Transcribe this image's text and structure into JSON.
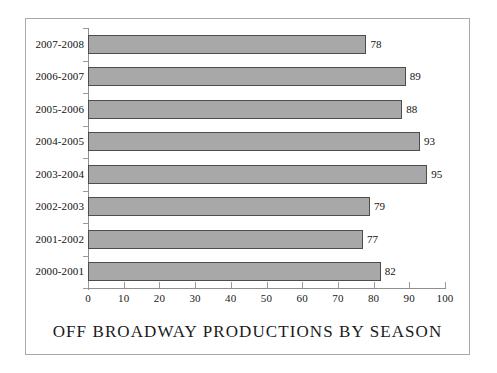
{
  "chart_data": {
    "type": "bar",
    "orientation": "horizontal",
    "title": "OFF BROADWAY PRODUCTIONS BY SEASON",
    "xlabel": "",
    "ylabel": "",
    "categories": [
      "2000-2001",
      "2001-2002",
      "2002-2003",
      "2003-2004",
      "2004-2005",
      "2005-2006",
      "2006-2007",
      "2007-2008"
    ],
    "values": [
      82,
      77,
      79,
      95,
      93,
      88,
      89,
      78
    ],
    "data_labels": [
      "82",
      "77",
      "79",
      "95",
      "93",
      "88",
      "89",
      "78"
    ],
    "xlim": [
      0,
      100
    ],
    "xticks": [
      0,
      10,
      20,
      30,
      40,
      50,
      60,
      70,
      80,
      90,
      100
    ],
    "xtick_labels": [
      "0",
      "10",
      "20",
      "30",
      "40",
      "50",
      "60",
      "70",
      "80",
      "90",
      "100"
    ],
    "grid": false,
    "legend": null,
    "bar_fill_color": "#a8a8a8",
    "bar_border_color": "#4d4d4d",
    "axis_color": "#8f8f8f",
    "frame_color": "#a8a8a8",
    "text_color": "#1a1a1a",
    "background_color": "#ffffff"
  }
}
